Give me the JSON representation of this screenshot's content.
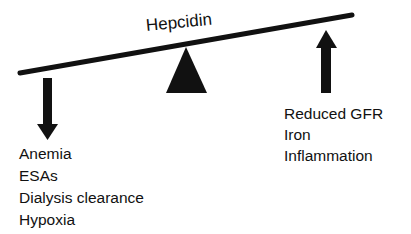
{
  "diagram": {
    "title": "Hepcidin",
    "left_factors": {
      "direction": "down",
      "items": [
        "Anemia",
        "ESAs",
        "Dialysis clearance",
        "Hypoxia"
      ]
    },
    "right_factors": {
      "direction": "up",
      "items": [
        "Reduced GFR",
        "Iron",
        "Inflammation"
      ]
    },
    "colors": {
      "ink": "#111111",
      "background": "#ffffff"
    }
  }
}
